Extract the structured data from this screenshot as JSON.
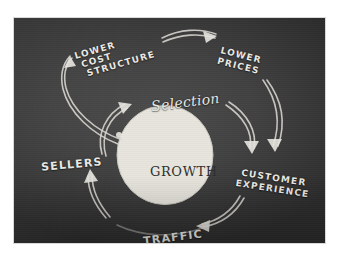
{
  "page": {
    "background_color": "#ffffff",
    "ghost_text_line1": "",
    "ghost_text_line2": ""
  },
  "photo": {
    "name": "amazon-flywheel-sketch-photo",
    "surface_color": "#414141",
    "chalk_color": "#e6e4de",
    "hub_fill_color": "#e7e5dd"
  },
  "diagram": {
    "type": "virtuous-cycle-flywheel",
    "hub": {
      "label": "GROWTH"
    },
    "nodes": [
      {
        "id": "lower-cost-structure",
        "label_lines": [
          "LOWER",
          "COST",
          "STRUCTURE"
        ],
        "label": "LOWER COST STRUCTURE",
        "style": "block-caps",
        "position": "top-left"
      },
      {
        "id": "lower-prices",
        "label_lines": [
          "LOWER",
          "PRICES"
        ],
        "label": "LOWER PRICES",
        "style": "block-caps",
        "position": "top-right"
      },
      {
        "id": "selection",
        "label": "Selection",
        "style": "script",
        "position": "top-center"
      },
      {
        "id": "customer-experience",
        "label_lines": [
          "CUSTOMER",
          "EXPERIENCE"
        ],
        "label": "CUSTOMER EXPERIENCE",
        "style": "block-caps",
        "position": "right"
      },
      {
        "id": "traffic",
        "label": "TRAFFIC",
        "style": "block-caps",
        "position": "bottom"
      },
      {
        "id": "sellers",
        "label": "SELLERS",
        "style": "block-caps",
        "position": "left"
      }
    ],
    "arrows": [
      {
        "id": "growth-to-lower-cost",
        "from": "growth",
        "to": "lower-cost-structure"
      },
      {
        "id": "lower-cost-to-lower-prices",
        "from": "lower-cost-structure",
        "to": "lower-prices"
      },
      {
        "id": "lower-prices-to-customer-experience",
        "from": "lower-prices",
        "to": "customer-experience"
      },
      {
        "id": "selection-to-customer-experience",
        "from": "selection",
        "to": "customer-experience"
      },
      {
        "id": "customer-experience-to-traffic",
        "from": "customer-experience",
        "to": "traffic"
      },
      {
        "id": "traffic-to-sellers",
        "from": "traffic",
        "to": "sellers"
      },
      {
        "id": "sellers-to-selection",
        "from": "sellers",
        "to": "selection"
      }
    ]
  }
}
